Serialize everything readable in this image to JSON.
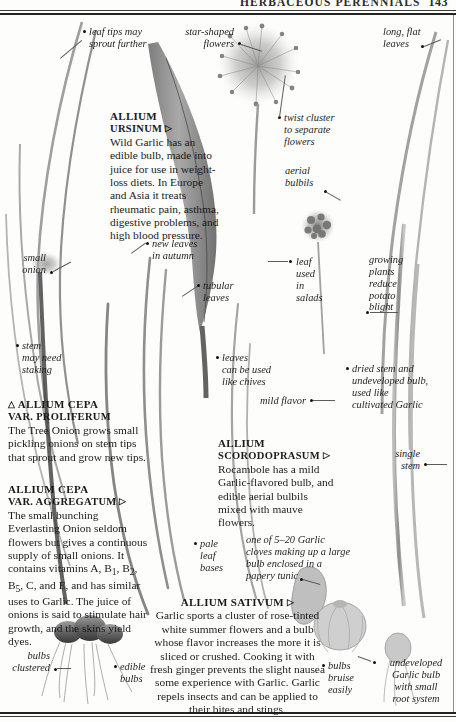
{
  "running_head": {
    "title": "HERBACEOUS PERENNIALS",
    "page_number": "143"
  },
  "species_blocks": [
    {
      "id": "allium-ursinum",
      "name": "ALLIUM",
      "name_line2": "URSINUM",
      "marker": "▷",
      "body": "Wild Garlic has an edible bulb, made into juice for use in weight-loss diets. In Europe and Asia it treats rheumatic pain, asthma, digestive problems, and high blood pressure."
    },
    {
      "id": "allium-cepa-proliferum",
      "marker_before": "△",
      "name": "ALLIUM CEPA",
      "name_line2": "VAR. PROLIFERUM",
      "body": "The Tree Onion grows small pickling onions on stem tips that sprout and grow new tips."
    },
    {
      "id": "allium-cepa-aggregatum",
      "name": "ALLIUM CEPA",
      "name_line2": "VAR. AGGREGATUM",
      "marker": "▷",
      "body": "The small bunching Everlasting Onion seldom flowers but gives a continuous supply of small onions. It contains vitamins A, B1, B2, B5, C, and E, and has similar uses to Garlic. The juice of onions is said to stimulate hair growth, and the skins yield dyes."
    },
    {
      "id": "allium-scorodoprasum",
      "name": "ALLIUM",
      "name_line2": "SCORODOPRASUM",
      "marker": "▷",
      "body": "Rocambole has a mild Garlic-flavored bulb, and edible aerial bulbils mixed with mauve flowers."
    },
    {
      "id": "allium-sativum",
      "name": "ALLIUM SATIVUM",
      "marker": "▷",
      "body": "Garlic sports a cluster of rose-tinted white summer flowers and a bulb whose flavor increases the more it is sliced or crushed. Cooking it with fresh ginger prevents the slight nausea some experience with Garlic. Garlic repels insects and can be applied to their bites and stings."
    }
  ],
  "callouts": [
    {
      "id": "leaf-tips",
      "text": "leaf tips may\nsprout further"
    },
    {
      "id": "star-flowers",
      "text": "star-shaped\nflowers"
    },
    {
      "id": "long-flat-leaves",
      "text": "long, flat\nleaves"
    },
    {
      "id": "twist-cluster",
      "text": "twist cluster\nto separate\nflowers"
    },
    {
      "id": "aerial-bulbils",
      "text": "aerial\nbulbils"
    },
    {
      "id": "small-onion",
      "text": "small\nonion"
    },
    {
      "id": "new-leaves",
      "text": "new leaves\nin autumn"
    },
    {
      "id": "tubular-leaves",
      "text": "tubular\nleaves"
    },
    {
      "id": "leaf-salads",
      "text": "leaf\nused\nin\nsalads"
    },
    {
      "id": "growing-plants",
      "text": "growing\nplants\nreduce\npotato\nblight"
    },
    {
      "id": "stem-staking",
      "text": "stem\nmay need\nstaking"
    },
    {
      "id": "leaves-chives",
      "text": "leaves\ncan be used\nlike chives"
    },
    {
      "id": "dried-stem",
      "text": "dried stem and\nundeveloped bulb,\nused like\ncultivated Garlic"
    },
    {
      "id": "mild-flavor",
      "text": "mild flavor"
    },
    {
      "id": "single-stem",
      "text": "single\nstem"
    },
    {
      "id": "pale-leaf-bases",
      "text": "pale\nleaf\nbases"
    },
    {
      "id": "garlic-cloves",
      "text": "one of 5–20 Garlic\ncloves making up a large\nbulb enclosed in a\npapery tunic"
    },
    {
      "id": "bulbs-clustered",
      "text": "bulbs\nclustered"
    },
    {
      "id": "edible-bulbs",
      "text": "edible\nbulbs"
    },
    {
      "id": "bulbs-bruise",
      "text": "bulbs\nbruise\neasily"
    },
    {
      "id": "undeveloped-garlic",
      "text": "undeveloped\nGarlic bulb\nwith small\nroot system"
    }
  ],
  "colors": {
    "rule": "#232323",
    "text": "#1a1a1a",
    "leader": "#5c5c5c",
    "plant_dark": "#4a4a4a",
    "plant_mid": "#8a8a8a",
    "plant_light": "#bdbdbd"
  }
}
